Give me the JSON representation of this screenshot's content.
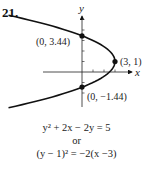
{
  "problem_number": "21.",
  "chart_data": {
    "type": "line",
    "title": "",
    "xlabel": "x",
    "ylabel": "y",
    "xlim": [
      -3.2,
      5.5
    ],
    "ylim": [
      -2.8,
      6.5
    ],
    "grid": false,
    "series": [
      {
        "name": "parabola",
        "equation": "(y - 1)^2 = -2(x - 3)",
        "y_range": [
          -3.4,
          5.4
        ]
      }
    ],
    "points": [
      {
        "x": 0,
        "y": 3.44,
        "label": "(0, 3.44)"
      },
      {
        "x": 3,
        "y": 1,
        "label": "(3, 1)"
      },
      {
        "x": 0,
        "y": -1.44,
        "label": "(0, −1.44)"
      }
    ],
    "x_ticks": [
      1,
      2,
      3
    ],
    "y_ticks": [
      -2,
      -1,
      1,
      2,
      3,
      4,
      5
    ]
  },
  "equations": {
    "line1": "y² + 2x − 2y = 5",
    "or": "or",
    "line2": "(y − 1)² = −2(x −3)"
  }
}
